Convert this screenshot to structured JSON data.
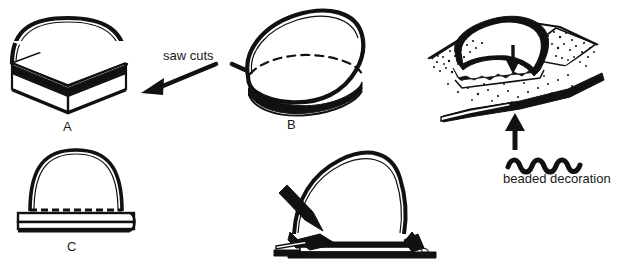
{
  "illustration": {
    "title_cutoff_partial": "and a bezel is burnished",
    "background_color": "#ffffff",
    "ink_color": "#111111",
    "subject": "line-art diagram of cutting and setting a domed cabochon stone",
    "panels": [
      {
        "id": "A",
        "letter": "A",
        "description": "half-dome cabochon on a flat slab base seen in three-quarter perspective, with dark saw-cut band"
      },
      {
        "id": "B",
        "letter": "B",
        "description": "egg-shaped domed cabochon in perspective with dashed hidden ellipse and dark base band"
      },
      {
        "id": "C",
        "letter": "C",
        "description": "front elevation of dome seated in a bezel with dashed beaded edge above the rim"
      },
      {
        "id": "D",
        "letter": "D",
        "description": "side view of a graver tool pushing metal against the dome set in its bezel"
      }
    ],
    "annotations": [
      {
        "id": "saw-cuts",
        "text": "saw cuts",
        "arrows": 2,
        "arrow_directions": [
          "down-left",
          "down-right"
        ]
      },
      {
        "id": "beaded-decoration",
        "text": "beaded decoration",
        "icon": "wavy-beaded-line",
        "arrows": 1,
        "arrow_directions": [
          "up"
        ]
      },
      {
        "id": "setting-arrow",
        "text": "",
        "arrows": 1,
        "arrow_directions": [
          "down"
        ]
      }
    ]
  }
}
